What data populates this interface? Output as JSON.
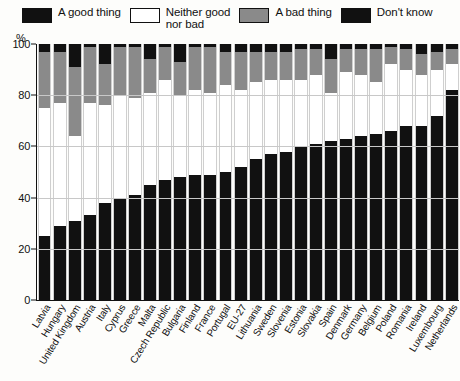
{
  "legend": {
    "items": [
      {
        "label": "A good thing",
        "key": "good",
        "color": "#111111",
        "swatch": "sw-good"
      },
      {
        "label": "Neither good\nnor bad",
        "key": "neither",
        "color": "#ffffff",
        "swatch": "sw-neither"
      },
      {
        "label": "A bad thing",
        "key": "bad",
        "color": "#8a8a8a",
        "swatch": "sw-bad"
      },
      {
        "label": "Don't know",
        "key": "dk",
        "color": "#111111",
        "swatch": "sw-dk"
      }
    ]
  },
  "axes": {
    "y_unit": "%",
    "y_ticks": [
      "100",
      "80",
      "60",
      "40",
      "20",
      "0"
    ]
  },
  "chart_data": {
    "type": "bar",
    "subtype": "stacked-100-percent-vertical",
    "title": "",
    "xlabel": "",
    "ylabel": "%",
    "ylim": [
      0,
      100
    ],
    "grid": true,
    "legend_position": "top",
    "categories": [
      "Latvia",
      "Hungary",
      "United Kingdom",
      "Austria",
      "Italy",
      "Cyprus",
      "Greece",
      "Malta",
      "Czech Republic",
      "Bulgaria",
      "Finland",
      "France",
      "Portugal",
      "EU-27",
      "Lithuania",
      "Sweden",
      "Slovenia",
      "Estonia",
      "Slovakia",
      "Spain",
      "Denmark",
      "Germany",
      "Belgium",
      "Poland",
      "Romania",
      "Ireland",
      "Luxembourg",
      "Netherlands"
    ],
    "series": [
      {
        "name": "A good thing",
        "color": "#111111",
        "values": [
          25,
          29,
          31,
          33,
          38,
          40,
          41,
          45,
          47,
          48,
          49,
          49,
          50,
          52,
          55,
          57,
          58,
          60,
          61,
          62,
          63,
          64,
          65,
          66,
          68,
          68,
          72,
          82
        ]
      },
      {
        "name": "Neither good nor bad",
        "color": "#ffffff",
        "values": [
          50,
          48,
          33,
          44,
          38,
          40,
          38,
          36,
          39,
          32,
          33,
          32,
          34,
          30,
          30,
          29,
          28,
          26,
          27,
          19,
          26,
          24,
          20,
          26,
          22,
          20,
          18,
          10
        ]
      },
      {
        "name": "A bad thing",
        "color": "#8a8a8a",
        "values": [
          22,
          20,
          27,
          22,
          16,
          19,
          20,
          13,
          13,
          13,
          17,
          18,
          13,
          15,
          12,
          11,
          11,
          12,
          10,
          13,
          9,
          10,
          13,
          7,
          8,
          8,
          7,
          6
        ]
      },
      {
        "name": "Don't know",
        "color": "#111111",
        "values": [
          3,
          3,
          9,
          1,
          8,
          1,
          1,
          6,
          1,
          7,
          1,
          1,
          3,
          3,
          3,
          3,
          3,
          2,
          2,
          6,
          2,
          2,
          2,
          1,
          2,
          4,
          3,
          2
        ]
      }
    ]
  }
}
